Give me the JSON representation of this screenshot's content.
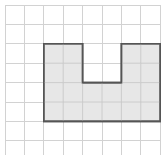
{
  "figure": {
    "type": "grid-shape-diagram",
    "background_color": "#ffffff"
  },
  "grid": {
    "name": "square-grid",
    "columns": 8,
    "rows": 8,
    "origin_x": 5,
    "origin_y": 5,
    "cell_size": 19.4,
    "line_color": "#d2d2d2",
    "line_width": 1,
    "border_color": "#d2d2d2"
  },
  "shape": {
    "name": "u-shaped-polygon",
    "description": "Rectangle 6 cells wide by 4 cells tall with a 2 by 2 cell notch removed from the top center",
    "fill_color": "#e7e7e7",
    "stroke_color": "#555555",
    "stroke_width": 1.6,
    "bounding_box_cells": {
      "left_col": 2,
      "top_row": 2,
      "width_cells": 6,
      "height_cells": 4
    },
    "notch_cells": {
      "left_col": 4,
      "top_row": 2,
      "width_cells": 2,
      "height_cells": 2
    },
    "area_cells": 20,
    "vertices_cells": [
      [
        2,
        2
      ],
      [
        4,
        2
      ],
      [
        4,
        4
      ],
      [
        6,
        4
      ],
      [
        6,
        2
      ],
      [
        8,
        2
      ],
      [
        8,
        6
      ],
      [
        2,
        6
      ]
    ]
  }
}
